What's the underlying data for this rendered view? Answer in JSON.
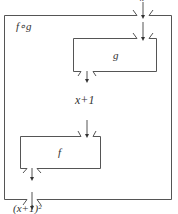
{
  "diagram": {
    "input_label": "x",
    "outer_box_label": "f∘g",
    "box_g_label": "g",
    "intermediate_label": "x+1",
    "box_f_label": "f",
    "output_label": "(x+1)²"
  },
  "colors": {
    "stroke": "#555555",
    "text": "#333333",
    "background": "#ffffff"
  }
}
